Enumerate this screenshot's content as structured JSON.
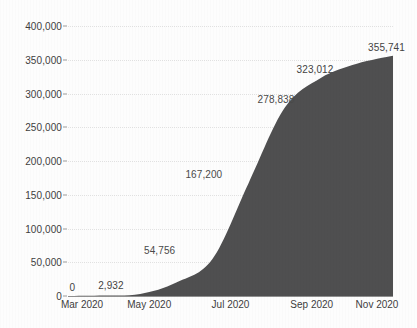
{
  "chart_data": {
    "type": "area",
    "title": "",
    "subtitle": "",
    "xlabel": "",
    "ylabel": "",
    "grid": true,
    "legend": false,
    "fill_color": "#4f4f50",
    "ylim": [
      0,
      400000
    ],
    "y_ticks": [
      "0",
      "50,000",
      "100,000",
      "150,000",
      "200,000",
      "250,000",
      "300,000",
      "350,000",
      "400,000"
    ],
    "y_tick_values": [
      0,
      50000,
      100000,
      150000,
      200000,
      250000,
      300000,
      350000,
      400000
    ],
    "x_ticks": [
      "Mar 2020",
      "May 2020",
      "Jul 2020",
      "Sep 2020",
      "Nov 2020"
    ],
    "x_tick_positions": [
      0,
      0.25,
      0.5,
      0.75,
      1.0
    ],
    "categories": [
      "Mar 2020",
      "Apr 2020",
      "May 2020",
      "Jun 2020",
      "Jul 2020",
      "Aug 2020",
      "Sep 2020",
      "Oct 2020",
      "Nov 2020",
      "Dec 2020"
    ],
    "values": [
      0,
      700,
      2932,
      20000,
      54756,
      167200,
      278838,
      323012,
      344000,
      355741
    ],
    "point_labels": [
      {
        "text": "0",
        "value": 0,
        "x_frac": 0.013,
        "y_value": 0,
        "clipped": false
      },
      {
        "text": "2,932",
        "value": 2932,
        "x_frac": 0.132,
        "y_value": 2932,
        "clipped": false
      },
      {
        "text": "54,756",
        "value": 54756,
        "x_frac": 0.282,
        "y_value": 54756,
        "clipped": true
      },
      {
        "text": "167,200",
        "value": 167200,
        "x_frac": 0.418,
        "y_value": 167200,
        "clipped": true
      },
      {
        "text": "278,838",
        "value": 278838,
        "x_frac": 0.64,
        "y_value": 278838,
        "clipped": true
      },
      {
        "text": "323,012",
        "value": 323012,
        "x_frac": 0.76,
        "y_value": 323012,
        "clipped": false
      },
      {
        "text": "355,741",
        "value": 355741,
        "x_frac": 0.98,
        "y_value": 355741,
        "clipped": false
      }
    ]
  }
}
